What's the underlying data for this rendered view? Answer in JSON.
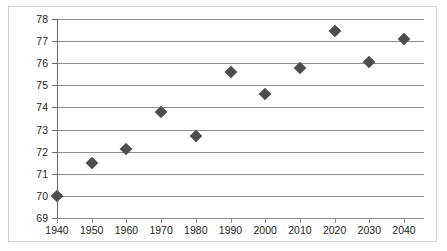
{
  "chart_data": {
    "type": "scatter",
    "title": "",
    "subtitle": "",
    "xlabel": "",
    "ylabel": "",
    "x": [
      1940,
      1950,
      1960,
      1970,
      1980,
      1990,
      2000,
      2010,
      2020,
      2030,
      2040
    ],
    "values": [
      70.0,
      71.5,
      72.1,
      73.8,
      72.7,
      75.6,
      74.6,
      75.8,
      77.45,
      76.05,
      77.1
    ],
    "series": [
      {
        "name": "",
        "values": [
          70.0,
          71.5,
          72.1,
          73.8,
          72.7,
          75.6,
          74.6,
          75.8,
          77.45,
          76.05,
          77.1
        ]
      }
    ],
    "xlim": [
      1940,
      2040
    ],
    "ylim": [
      69,
      78
    ],
    "xticks": [
      1940,
      1950,
      1960,
      1970,
      1980,
      1990,
      2000,
      2010,
      2020,
      2030,
      2040
    ],
    "xtick_labels": [
      "1940",
      "1950",
      "1960",
      "1970",
      "1980",
      "1990",
      "2000",
      "2010",
      "2020",
      "2030",
      "2040"
    ],
    "yticks": [
      69,
      70,
      71,
      72,
      73,
      74,
      75,
      76,
      77,
      78
    ],
    "ytick_labels": [
      "69",
      "70",
      "71",
      "72",
      "73",
      "74",
      "75",
      "76",
      "77",
      "78"
    ],
    "grid": true,
    "grid_axis": "y",
    "legend": false,
    "legend_position": "none",
    "marker_shape": "diamond",
    "marker_color": "#4d4d4d",
    "gridline_color": "#8e8e8e",
    "axis_color": "#6b6b6b",
    "background_color": "#ffffff",
    "frame_color": "#d2d2d2",
    "annotations": []
  }
}
